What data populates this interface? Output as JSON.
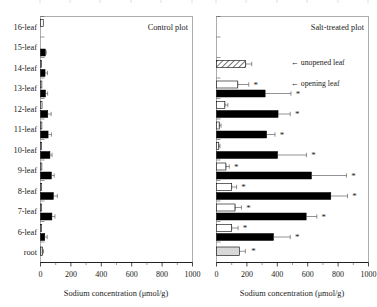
{
  "figure": {
    "width": 377,
    "height": 307,
    "background": "#ffffff"
  },
  "chart_data": {
    "type": "bar",
    "orientation": "horizontal",
    "title": "",
    "xlabel": "Sodium concentration (μmol/g)",
    "ylabel": "",
    "xlim": [
      0,
      1000
    ],
    "xticks": [
      0,
      200,
      400,
      600,
      800,
      1000
    ],
    "xticklabels": [
      "0",
      "200",
      "400",
      "600",
      "800",
      "1000"
    ],
    "categories": [
      "16-leaf",
      "15-leaf",
      "14-leaf",
      "13-leaf",
      "12-leaf",
      "11-leaf",
      "10-leaf",
      "9-leaf",
      "8-leaf",
      "7-leaf",
      "6-leaf",
      "root"
    ],
    "grid": false,
    "legend_position": "inside-right",
    "annotations": [
      {
        "text": "← unopened leaf",
        "near": "14-leaf"
      },
      {
        "text": "← opening leaf",
        "near": "13-leaf"
      }
    ],
    "significance_marker": "*",
    "panels": [
      {
        "id": "control",
        "title": "Control plot",
        "series": [
          {
            "name": "unopened / opening leaf (open bar)",
            "style": "open",
            "values": [
              18,
              0,
              7,
              9,
              10,
              9,
              8,
              9,
              8,
              8,
              8,
              0
            ],
            "errors": [
              0,
              0,
              0,
              0,
              0,
              0,
              0,
              0,
              0,
              0,
              0,
              0
            ],
            "stars": [
              false,
              false,
              false,
              false,
              false,
              false,
              false,
              false,
              false,
              false,
              false,
              false
            ]
          },
          {
            "name": "leaf blade (filled bar)",
            "style": "filled",
            "values": [
              0,
              32,
              30,
              33,
              48,
              50,
              62,
              72,
              85,
              75,
              28,
              0
            ],
            "errors": [
              0,
              6,
              16,
              14,
              22,
              22,
              14,
              18,
              26,
              20,
              16,
              0
            ],
            "stars": [
              false,
              false,
              false,
              false,
              false,
              false,
              false,
              false,
              false,
              false,
              false,
              false
            ]
          },
          {
            "name": "root (gray bar)",
            "style": "gray",
            "values": [
              0,
              0,
              0,
              0,
              0,
              0,
              0,
              0,
              0,
              0,
              0,
              14
            ],
            "errors": [
              0,
              0,
              0,
              0,
              0,
              0,
              0,
              0,
              0,
              0,
              0,
              6
            ],
            "stars": [
              false,
              false,
              false,
              false,
              false,
              false,
              false,
              false,
              false,
              false,
              false,
              false
            ]
          }
        ]
      },
      {
        "id": "salt",
        "title": "Salt-treated plot",
        "series": [
          {
            "name": "unopened / opening leaf (open or hatched bar)",
            "style": "open",
            "values": [
              0,
              0,
              192,
              140,
              55,
              18,
              15,
              62,
              100,
              122,
              100,
              0
            ],
            "errors": [
              0,
              0,
              40,
              72,
              20,
              12,
              8,
              22,
              32,
              42,
              42,
              0
            ],
            "stars": [
              false,
              false,
              false,
              true,
              false,
              false,
              false,
              true,
              true,
              true,
              true,
              false
            ],
            "hatched": [
              false,
              false,
              true,
              false,
              false,
              false,
              false,
              false,
              false,
              false,
              false,
              false
            ]
          },
          {
            "name": "leaf blade (filled bar)",
            "style": "filled",
            "values": [
              0,
              0,
              0,
              320,
              405,
              330,
              402,
              625,
              752,
              590,
              375,
              0
            ],
            "errors": [
              0,
              0,
              0,
              170,
              80,
              55,
              190,
              230,
              110,
              70,
              110,
              0
            ],
            "stars": [
              false,
              false,
              false,
              true,
              true,
              true,
              true,
              true,
              true,
              true,
              true,
              false
            ]
          },
          {
            "name": "root (gray bar)",
            "style": "gray",
            "values": [
              0,
              0,
              0,
              0,
              0,
              0,
              0,
              0,
              0,
              0,
              0,
              150
            ],
            "errors": [
              0,
              0,
              0,
              0,
              0,
              0,
              0,
              0,
              0,
              0,
              0,
              40
            ],
            "stars": [
              false,
              false,
              false,
              false,
              false,
              false,
              false,
              false,
              false,
              false,
              false,
              true
            ]
          }
        ]
      }
    ]
  }
}
